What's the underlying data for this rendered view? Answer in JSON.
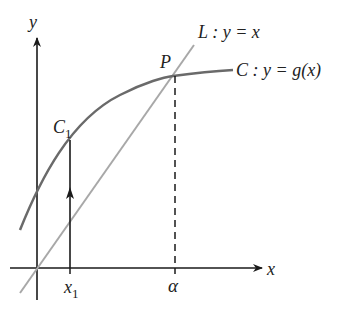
{
  "diagram": {
    "axes": {
      "x_label": "x",
      "y_label": "y"
    },
    "line": {
      "name": "L",
      "label": "L : y = x",
      "color": "#a8a8a8"
    },
    "curve": {
      "name": "C",
      "label": "C : y = g(x)",
      "color": "#6a6a6a"
    },
    "points": {
      "P": "P",
      "C1_main": "C",
      "C1_sub": "1"
    },
    "ticks": {
      "x1_main": "x",
      "x1_sub": "1",
      "alpha": "α"
    },
    "colors": {
      "axis": "#1a1a1a",
      "line": "#a8a8a8",
      "curve": "#6a6a6a"
    }
  }
}
